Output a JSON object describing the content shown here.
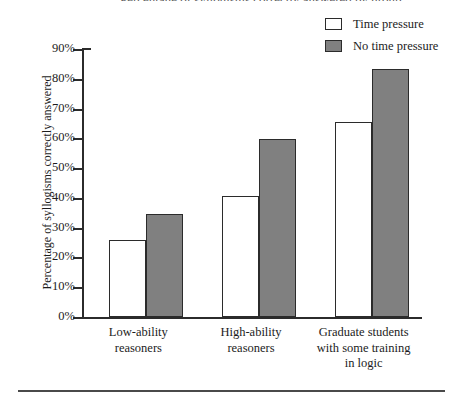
{
  "figure": {
    "bottom_rule": "",
    "clipped_title": "Percentage of syllogisms correctly answered by group"
  },
  "legend": {
    "position": "top-right",
    "items": [
      {
        "label": "Time pressure",
        "swatch": "hollow-square-icon",
        "color": "#ffffff"
      },
      {
        "label": "No time pressure",
        "swatch": "filled-square-icon",
        "color": "#808080"
      }
    ]
  },
  "axes": {
    "ylabel": "Percentage of syllogisms correctly answered",
    "yticks": [
      "0%",
      "10%",
      "20%",
      "30%",
      "40%",
      "50%",
      "60%",
      "70%",
      "80%",
      "90%"
    ],
    "ytick_values": [
      0,
      10,
      20,
      30,
      40,
      50,
      60,
      70,
      80,
      90
    ],
    "xticklabels": [
      "Low-ability\nreasoners",
      "High-ability\nreasoners",
      "Graduate students\nwith some training\nin logic"
    ]
  },
  "chart_data": {
    "type": "bar",
    "title": "Percentage of syllogisms correctly answered by group",
    "xlabel": "",
    "ylabel": "Percentage of syllogisms correctly answered",
    "ylim": [
      0,
      90
    ],
    "ytick_step": 10,
    "grid": false,
    "legend_position": "top-right",
    "categories": [
      "Low-ability reasoners",
      "High-ability reasoners",
      "Graduate students with some training in logic"
    ],
    "series": [
      {
        "name": "Time pressure",
        "color": "#ffffff",
        "values": [
          25.8,
          40.6,
          65.4
        ]
      },
      {
        "name": "No time pressure",
        "color": "#808080",
        "values": [
          34.6,
          59.7,
          83.2
        ]
      }
    ]
  },
  "categories_display": [
    {
      "line1": "Low-ability",
      "line2": "reasoners",
      "line3": ""
    },
    {
      "line1": "High-ability",
      "line2": "reasoners",
      "line3": ""
    },
    {
      "line1": "Graduate students",
      "line2": "with some training",
      "line3": "in logic"
    }
  ]
}
